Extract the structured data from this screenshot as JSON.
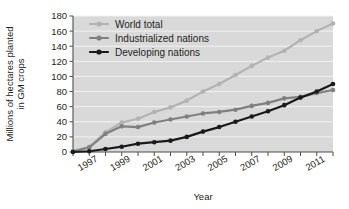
{
  "chart_data": {
    "type": "line",
    "title": "",
    "xlabel": "Year",
    "ylabel_line1": "Millions of hectares planted",
    "ylabel_line2": "in GM crops",
    "x": [
      1996,
      1997,
      1998,
      1999,
      2000,
      2001,
      2002,
      2003,
      2004,
      2005,
      2006,
      2007,
      2008,
      2009,
      2010,
      2011,
      2012
    ],
    "xlim": [
      1996,
      2012
    ],
    "ylim": [
      0,
      180
    ],
    "yticks": [
      0,
      20,
      40,
      60,
      80,
      100,
      120,
      140,
      160,
      180
    ],
    "xticks": [
      1996,
      1997,
      1998,
      1999,
      2000,
      2001,
      2002,
      2003,
      2004,
      2005,
      2006,
      2007,
      2008,
      2009,
      2010,
      2011,
      2012
    ],
    "xtick_labels": [
      "",
      "1997",
      "",
      "1999",
      "",
      "2001",
      "",
      "2003",
      "",
      "2005",
      "",
      "2007",
      "",
      "2009",
      "",
      "2011",
      ""
    ],
    "grid": "horizontal",
    "legend_position": "top-left-inside",
    "series": [
      {
        "name": "World total",
        "color": "#b3b3b3",
        "values": [
          1,
          7,
          26,
          39,
          44,
          53,
          59,
          68,
          80,
          90,
          102,
          114,
          125,
          134,
          148,
          160,
          170
        ]
      },
      {
        "name": "Industrialized nations",
        "color": "#808080",
        "values": [
          1,
          6,
          24,
          34,
          33,
          39,
          43,
          47,
          51,
          53,
          56,
          61,
          65,
          71,
          73,
          78,
          82
        ]
      },
      {
        "name": "Developing nations",
        "color": "#1a1a1a",
        "values": [
          0,
          1,
          4,
          7,
          11,
          13,
          15,
          20,
          27,
          33,
          40,
          47,
          54,
          62,
          72,
          80,
          90
        ]
      }
    ]
  },
  "colors": {
    "plot_background": "#d9d9d9",
    "gridline": "#f2f2f2",
    "axis": "#4d4d4d",
    "text": "#231f20"
  }
}
